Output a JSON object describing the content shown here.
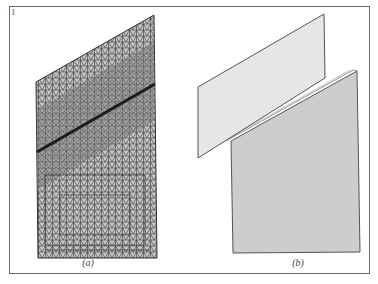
{
  "figure": {
    "number": "1",
    "panels": [
      {
        "id": "a",
        "label": "(a)",
        "description": "Triangular finite-element mesh of a parallelogram plate with refined mesh along a diagonal crack line",
        "polygon": [
          [
            36,
            82
          ],
          [
            154,
            15
          ],
          [
            157,
            258
          ],
          [
            38,
            258
          ]
        ],
        "crack_line": [
          [
            37,
            152
          ],
          [
            155,
            84
          ]
        ],
        "mesh_color": "#3a3a3a",
        "fill_color": "#bdbdbd"
      },
      {
        "id": "b",
        "label": "(b)",
        "description": "Two separated plate pieces along the crack",
        "upper_piece": {
          "polygon": [
            [
              198,
              87
            ],
            [
              324,
              14
            ],
            [
              325,
              78
            ],
            [
              198,
              158
            ]
          ],
          "fill_color": "#e6e6e6"
        },
        "lower_piece": {
          "polygon": [
            [
              231,
              141
            ],
            [
              357,
              71
            ],
            [
              360,
              252
            ],
            [
              233,
              253
            ]
          ],
          "fill_color": "#cdcdcd"
        },
        "edge_color": "#555555"
      }
    ]
  }
}
